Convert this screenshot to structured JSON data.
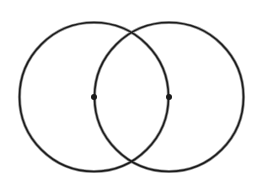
{
  "diagram": {
    "type": "vesica-piscis",
    "stroke_color": "#1a1a1a",
    "shadow_color": "#9a9a9a",
    "background": "#ffffff",
    "circles": [
      {
        "id": "left-circle",
        "cx": 94,
        "cy": 97,
        "r": 74.5
      },
      {
        "id": "right-circle",
        "cx": 169,
        "cy": 97,
        "r": 74.5
      }
    ],
    "center_points": [
      {
        "id": "left-center",
        "x": 94,
        "y": 97,
        "r": 3
      },
      {
        "id": "right-center",
        "x": 169,
        "y": 97,
        "r": 3
      }
    ]
  }
}
